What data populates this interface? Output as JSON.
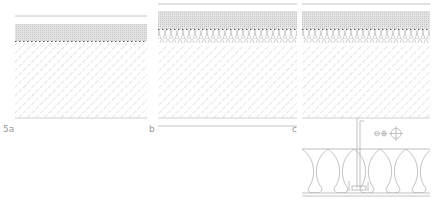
{
  "figure": {
    "panels": [
      {
        "id": "a",
        "label": "5a",
        "layers": [
          "finish line",
          "screed (gray hatched)",
          "membrane (dotted)",
          "concrete slab (diagonal hatch)"
        ]
      },
      {
        "id": "b",
        "label": "b",
        "layers": [
          "finish line",
          "screed (gray hatched)",
          "membrane (dotted)",
          "impact sound insulation (loops)",
          "concrete slab (diagonal hatch)",
          "ceiling line"
        ]
      },
      {
        "id": "c",
        "label": "c",
        "layers": [
          "finish line",
          "screed (gray hatched)",
          "membrane (dotted)",
          "impact sound insulation (loops)",
          "concrete slab (diagonal hatch)",
          "suspended hanger",
          "service symbols",
          "suspended insulation (loops)",
          "ceiling line"
        ]
      }
    ],
    "colors": {
      "line": "#b8b8b8",
      "hatch": "#c4c4c4",
      "screed": "#dcdcdc",
      "dots": "#555555",
      "label": "#9a9a9a"
    }
  }
}
